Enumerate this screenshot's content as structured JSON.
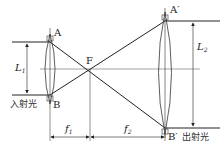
{
  "diagram": {
    "labels": {
      "A": "A",
      "B": "B",
      "F": "F",
      "A_prime": "A′",
      "B_prime": "B′",
      "L1_main": "L",
      "L1_sub": "1",
      "L2_main": "L",
      "L2_sub": "2",
      "f1_main": "f",
      "f1_sub": "1",
      "f2_main": "f",
      "f2_sub": "2",
      "incident_light": "入射光",
      "outgoing_light": "出射光"
    },
    "colors": {
      "line": "#222222",
      "axis": "#555555"
    }
  }
}
